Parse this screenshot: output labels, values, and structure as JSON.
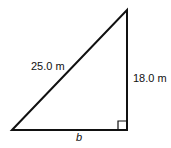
{
  "diagram": {
    "type": "right-triangle",
    "hypotenuse_label": "25.0 m",
    "vertical_leg_label": "18.0 m",
    "base_label": "b",
    "right_angle_marker": true,
    "colors": {
      "stroke": "#111111",
      "background": "#ffffff"
    }
  }
}
